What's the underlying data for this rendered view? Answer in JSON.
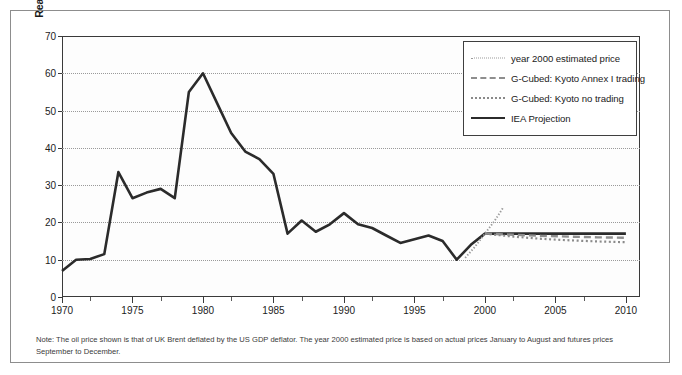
{
  "figure": {
    "note": "Note: The oil price shown is that of UK Brent deflated by the US GDP deflator. The year 2000 estimated price is based on actual prices January to August and futures prices September to December."
  },
  "legend": {
    "position": "top-right inside plot",
    "entries": [
      {
        "label": "year 2000 estimated price",
        "style": "fine-dotted",
        "color": "#9b9b9b",
        "key": "key-dotted-fine"
      },
      {
        "label": "G-Cubed: Kyoto Annex I trading",
        "style": "dashed",
        "color": "#8e8e8e",
        "key": "key-dashed"
      },
      {
        "label": "G-Cubed: Kyoto no trading",
        "style": "dotted",
        "color": "#8a8a8a",
        "key": "key-dotted"
      },
      {
        "label": "IEA Projection",
        "style": "solid",
        "color": "#2b2b2b",
        "key": "key-solid"
      }
    ]
  },
  "chart_data": {
    "type": "line",
    "title": "",
    "xlabel": "",
    "ylabel": "Real oil price $(1990) per barrel",
    "xlim": [
      1970,
      2011
    ],
    "ylim": [
      0,
      70
    ],
    "grid": true,
    "y_ticks": [
      0,
      10,
      20,
      30,
      40,
      50,
      60,
      70
    ],
    "x_ticks_major": [
      1970,
      1975,
      1980,
      1985,
      1990,
      1995,
      2000,
      2005,
      2010
    ],
    "x_ticks_minor": [
      1972,
      1977,
      1982,
      1987,
      1992,
      1997,
      2002,
      2007
    ],
    "series": [
      {
        "name": "Historical / IEA Projection",
        "style": "solid",
        "color": "#2b2b2b",
        "x": [
          1970,
          1971,
          1972,
          1973,
          1974,
          1975,
          1976,
          1977,
          1978,
          1979,
          1980,
          1981,
          1982,
          1983,
          1984,
          1985,
          1986,
          1987,
          1988,
          1989,
          1990,
          1991,
          1992,
          1993,
          1994,
          1995,
          1996,
          1997,
          1998,
          1999,
          2000,
          2001,
          2002,
          2003,
          2004,
          2005,
          2006,
          2007,
          2008,
          2009,
          2010
        ],
        "values": [
          7.0,
          10.0,
          10.2,
          11.5,
          33.5,
          26.5,
          28.0,
          29.0,
          26.5,
          55.0,
          60.0,
          52.0,
          44.0,
          39.0,
          37.0,
          33.0,
          17.0,
          20.5,
          17.5,
          19.5,
          22.5,
          19.5,
          18.5,
          16.5,
          14.5,
          15.5,
          16.5,
          15.0,
          10.0,
          14.0,
          17.0,
          17.0,
          17.0,
          17.0,
          17.0,
          17.0,
          17.0,
          17.0,
          17.0,
          17.0,
          17.0
        ]
      },
      {
        "name": "year 2000 estimated price",
        "style": "fine-dotted",
        "color": "#9b9b9b",
        "x": [
          1998.6,
          1999.3,
          2000.0,
          2000.7,
          2001.3
        ],
        "values": [
          10.5,
          13.5,
          17.0,
          20.5,
          24.0
        ]
      },
      {
        "name": "G-Cubed: Kyoto Annex I trading",
        "style": "dashed",
        "color": "#8e8e8e",
        "x": [
          2000,
          2002,
          2004,
          2006,
          2008,
          2010
        ],
        "values": [
          17.0,
          16.7,
          16.4,
          16.2,
          16.0,
          15.9
        ]
      },
      {
        "name": "G-Cubed: Kyoto no trading",
        "style": "dotted",
        "color": "#8a8a8a",
        "x": [
          2000,
          2002,
          2004,
          2006,
          2008,
          2010
        ],
        "values": [
          17.0,
          16.2,
          15.6,
          15.2,
          14.9,
          14.7
        ]
      }
    ]
  }
}
